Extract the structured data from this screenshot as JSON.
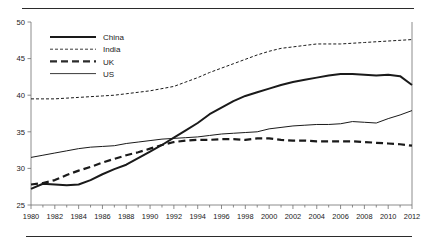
{
  "chart_data": {
    "type": "line",
    "title": "",
    "subtitle": "",
    "xlabel": "",
    "ylabel": "",
    "xlim": [
      1980,
      2012
    ],
    "ylim": [
      25,
      50
    ],
    "grid": false,
    "legend_position": "top-left-inside",
    "y_ticks": [
      25,
      30,
      35,
      40,
      45,
      50
    ],
    "x_ticks": [
      1980,
      1982,
      1984,
      1986,
      1988,
      1990,
      1992,
      1994,
      1996,
      1998,
      2000,
      2002,
      2004,
      2006,
      2008,
      2010,
      2012
    ],
    "x_minor_tick_step": 1,
    "x": [
      1980,
      1981,
      1982,
      1983,
      1984,
      1985,
      1986,
      1987,
      1988,
      1989,
      1990,
      1991,
      1992,
      1993,
      1994,
      1995,
      1996,
      1997,
      1998,
      1999,
      2000,
      2001,
      2002,
      2003,
      2004,
      2005,
      2006,
      2007,
      2008,
      2009,
      2010,
      2011,
      2012
    ],
    "series": [
      {
        "name": "China",
        "style": "solid-thick",
        "color": "#1a1a1a",
        "width": 2.0,
        "dash": "none",
        "values": [
          27.2,
          27.9,
          27.8,
          27.7,
          27.8,
          28.4,
          29.2,
          29.9,
          30.5,
          31.4,
          32.3,
          33.2,
          34.2,
          35.2,
          36.2,
          37.4,
          38.3,
          39.2,
          39.9,
          40.4,
          40.9,
          41.4,
          41.8,
          42.1,
          42.4,
          42.7,
          42.9,
          42.9,
          42.8,
          42.7,
          42.8,
          42.6,
          41.4
        ]
      },
      {
        "name": "India",
        "style": "dashed-thin",
        "color": "#3a3a3a",
        "width": 1.0,
        "dash": "3,2",
        "values": [
          39.5,
          39.5,
          39.5,
          39.6,
          39.7,
          39.8,
          39.9,
          40.0,
          40.2,
          40.4,
          40.6,
          40.9,
          41.2,
          41.8,
          42.4,
          43.1,
          43.7,
          44.3,
          44.9,
          45.5,
          46.0,
          46.4,
          46.6,
          46.8,
          47.0,
          47.0,
          47.0,
          47.1,
          47.2,
          47.3,
          47.4,
          47.5,
          47.6
        ]
      },
      {
        "name": "UK",
        "style": "dashed-thick",
        "color": "#2b2b2b",
        "width": 2.2,
        "dash": "7,4",
        "values": [
          27.8,
          28.0,
          28.4,
          29.1,
          29.7,
          30.2,
          30.8,
          31.3,
          31.8,
          32.2,
          32.7,
          33.2,
          33.6,
          33.8,
          33.9,
          33.9,
          34.0,
          34.0,
          33.9,
          34.1,
          34.1,
          33.9,
          33.8,
          33.8,
          33.7,
          33.7,
          33.7,
          33.7,
          33.6,
          33.5,
          33.4,
          33.3,
          33.1
        ]
      },
      {
        "name": "US",
        "style": "solid-thin",
        "color": "#3a3a3a",
        "width": 1.0,
        "values": [
          31.5,
          31.8,
          32.1,
          32.4,
          32.7,
          32.9,
          33.0,
          33.1,
          33.4,
          33.6,
          33.8,
          34.0,
          34.1,
          34.2,
          34.3,
          34.5,
          34.7,
          34.8,
          34.9,
          35.0,
          35.4,
          35.6,
          35.8,
          35.9,
          36.0,
          36.0,
          36.1,
          36.4,
          36.3,
          36.2,
          36.8,
          37.3,
          37.9
        ]
      }
    ]
  },
  "legend": {
    "items": [
      {
        "label": "China"
      },
      {
        "label": "India"
      },
      {
        "label": "UK"
      },
      {
        "label": "US"
      }
    ]
  },
  "axis": {
    "y_labels": [
      "50",
      "45",
      "40",
      "35",
      "30",
      "25"
    ],
    "x_labels": [
      "1980",
      "1982",
      "1984",
      "1986",
      "1988",
      "1990",
      "1992",
      "1994",
      "1996",
      "1998",
      "2000",
      "2002",
      "2004",
      "2006",
      "2008",
      "2010",
      "2012"
    ]
  },
  "colors": {
    "background": "#ffffff",
    "ink": "#1a1a1a",
    "axis": "#6e6e6e",
    "rule": "#2b2b2b"
  }
}
